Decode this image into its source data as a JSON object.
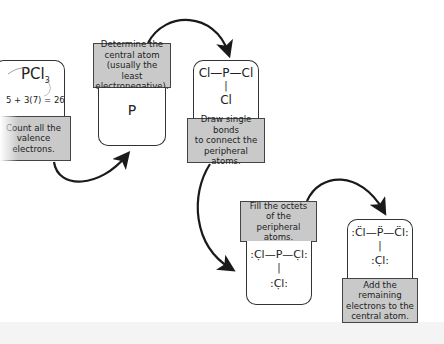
{
  "steps": [
    {
      "label": [
        "Count all the",
        "valence",
        "electrons."
      ],
      "formula": "PCl",
      "formula_sub": "3",
      "equation": "5 + 3(7) = 26"
    },
    {
      "label": [
        "Determine the",
        "central atom",
        "(usually the least",
        "electronegative)."
      ],
      "structure": "P"
    },
    {
      "label": [
        "Draw single bonds",
        "to connect the",
        "peripheral atoms."
      ],
      "structure_top": "Cl—P—Cl",
      "structure_bond": "|",
      "structure_bottom": "Cl"
    },
    {
      "label": [
        "Fill the octets",
        "of the peripheral",
        "atoms."
      ],
      "structure_top": ":C̣l—P—C̣l:",
      "structure_bond": "|",
      "structure_bottom": ":C̣l:"
    },
    {
      "label": [
        "Add the remaining",
        "electrons to the",
        "central atom."
      ],
      "structure_top": ":C̈l—P̈—C̈l:",
      "structure_bond": "|",
      "structure_bottom": ":C̣l:"
    }
  ],
  "colors": {
    "label_bg": "#c9c9c9",
    "border": "#333333",
    "arrow": "#1a1a1a"
  }
}
